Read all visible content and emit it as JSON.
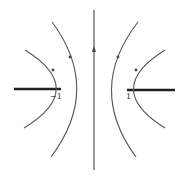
{
  "diagram": {
    "labels": {
      "left_branch_point": "−1",
      "right_branch_point": "1"
    },
    "elements": {
      "central_axis": "vertical line through origin with upward arrow",
      "branch_cuts": [
        "(-∞, -1]",
        "[1, ∞)"
      ],
      "curves": [
        {
          "name": "left-inner-hyperbola",
          "side": "left",
          "direction": "up"
        },
        {
          "name": "left-outer-hyperbola",
          "side": "left",
          "direction": "up"
        },
        {
          "name": "right-inner-hyperbola",
          "side": "right",
          "direction": "up"
        },
        {
          "name": "right-outer-hyperbola",
          "side": "right",
          "direction": "up"
        }
      ]
    },
    "colors": {
      "line": "#555555",
      "cut": "#222222",
      "background": "#ffffff"
    }
  }
}
